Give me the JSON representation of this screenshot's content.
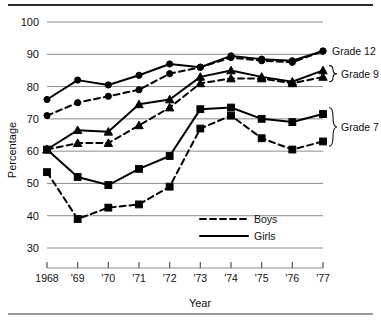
{
  "chart_data": {
    "type": "line",
    "title": "",
    "xlabel": "Year",
    "ylabel": "Percentage",
    "x": [
      1968,
      1969,
      1970,
      1971,
      1972,
      1973,
      1974,
      1975,
      1976,
      1977
    ],
    "xtick_labels": [
      "1968",
      "'69",
      "'70",
      "'71",
      "'72",
      "'73",
      "'74",
      "'75",
      "'76",
      "'77"
    ],
    "ytick_labels": [
      "30",
      "40",
      "50",
      "60",
      "70",
      "80",
      "90",
      "100"
    ],
    "ylim": [
      30,
      100
    ],
    "xlim": [
      1968,
      1977
    ],
    "grid": true,
    "legend_position": "inside-lower-right",
    "legend": [
      {
        "label": "Boys",
        "style": "dashed"
      },
      {
        "label": "Girls",
        "style": "solid"
      }
    ],
    "annotations": [
      {
        "label": "Grade 12",
        "brace": false
      },
      {
        "label": "Grade 9",
        "brace": true
      },
      {
        "label": "Grade 7",
        "brace": true
      }
    ],
    "series": [
      {
        "name": "Grade 12 Girls",
        "group": "Grade 12",
        "sex": "Girls",
        "style": "solid",
        "marker": "circle",
        "values": [
          76,
          82,
          80.5,
          83.5,
          87,
          86,
          89.5,
          88.5,
          88,
          91
        ]
      },
      {
        "name": "Grade 12 Boys",
        "group": "Grade 12",
        "sex": "Boys",
        "style": "dashed",
        "marker": "circle",
        "values": [
          71,
          75,
          77,
          79,
          84,
          86,
          89,
          88,
          87.5,
          91
        ]
      },
      {
        "name": "Grade 9 Girls",
        "group": "Grade 9",
        "sex": "Girls",
        "style": "solid",
        "marker": "triangle",
        "values": [
          60.5,
          66.5,
          66,
          74.5,
          76,
          83,
          85,
          83,
          81.5,
          85
        ]
      },
      {
        "name": "Grade 9 Boys",
        "group": "Grade 9",
        "sex": "Boys",
        "style": "dashed",
        "marker": "triangle",
        "values": [
          60.5,
          62.5,
          62.5,
          68,
          73.5,
          81,
          82.5,
          82.5,
          81,
          83
        ]
      },
      {
        "name": "Grade 7 Girls",
        "group": "Grade 7",
        "sex": "Girls",
        "style": "solid",
        "marker": "square",
        "values": [
          60.5,
          52,
          49.5,
          54.5,
          58.5,
          73,
          73.5,
          70,
          69,
          71.5
        ]
      },
      {
        "name": "Grade 7 Boys",
        "group": "Grade 7",
        "sex": "Boys",
        "style": "dashed",
        "marker": "square",
        "values": [
          53.5,
          39,
          42.5,
          43.5,
          49,
          67,
          71,
          64,
          60.5,
          63
        ]
      }
    ],
    "colors": {
      "line": "#000000",
      "grid": "#8c8c8c",
      "background": "#ffffff"
    }
  }
}
